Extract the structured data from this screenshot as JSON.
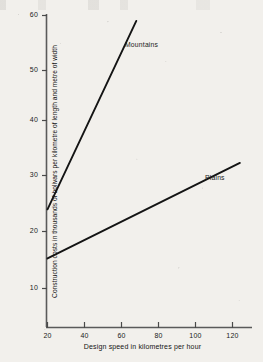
{
  "chart_data": {
    "type": "line",
    "title": "",
    "xlabel": "Design speed in kilometres per hour",
    "ylabel": "Construction costs in thousands of bolivars per kilometre of length and metre of width",
    "xlim": [
      10,
      130
    ],
    "ylim": [
      0,
      62
    ],
    "xticks": [
      20,
      40,
      60,
      80,
      100,
      120
    ],
    "yticks": [
      10,
      20,
      30,
      40,
      50,
      60
    ],
    "xtick_labels": [
      "20",
      "40",
      "60",
      "80",
      "100",
      "120"
    ],
    "ytick_labels": [
      "10",
      "20",
      "30",
      "40",
      "50",
      "60"
    ],
    "grid": false,
    "legend_position": "inline-annotations",
    "series": [
      {
        "name": "Mountains",
        "label": "Mountains",
        "color": "#141414",
        "x": [
          20,
          68
        ],
        "values": [
          24.5,
          59.0
        ]
      },
      {
        "name": "Plains",
        "label": "Plains",
        "color": "#141414",
        "x": [
          20,
          124
        ],
        "values": [
          15.5,
          33.0
        ]
      }
    ],
    "annotations": [
      {
        "text": "Mountains",
        "x": 78,
        "y": 55
      },
      {
        "text": "Plains",
        "x": 112,
        "y": 28
      }
    ]
  },
  "axes": {
    "x_axis_name": "design-speed-axis",
    "y_axis_name": "construction-cost-axis"
  },
  "colors": {
    "paper": "#f2f0ec",
    "ink": "#141414",
    "axis": "#5a5a5a"
  }
}
